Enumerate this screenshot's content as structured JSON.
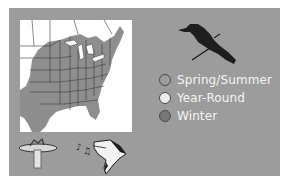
{
  "range_card": {
    "map": {
      "region": "eastern-north-america-range-map",
      "range_fill": "#8e8e8e",
      "background": "#ffffff"
    },
    "bird_silhouette": {
      "icon": "grackle-silhouette-icon"
    },
    "legend": [
      {
        "label": "Spring/Summer",
        "color": "#9c9c9c"
      },
      {
        "label": "Year-Round",
        "color": "#ececec"
      },
      {
        "label": "Winter",
        "color": "#787878"
      }
    ],
    "icons": [
      {
        "name": "bird-bath-icon"
      },
      {
        "name": "song-notes-icon"
      },
      {
        "name": "woodpecker-head-icon"
      }
    ],
    "colors": {
      "panel": "#9c9c9c",
      "text": "#f4f4f4"
    }
  }
}
